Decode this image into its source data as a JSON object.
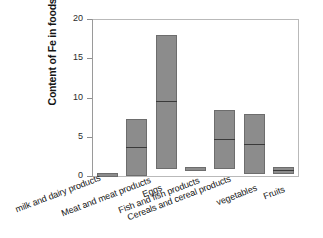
{
  "chart_data": {
    "type": "bar",
    "title": "",
    "xlabel": "",
    "ylabel": "Content of Fe in foods",
    "ylim": [
      0,
      20
    ],
    "yticks": [
      0,
      5,
      10,
      15,
      20
    ],
    "ytick_labels": [
      "0",
      "5",
      "10",
      "15",
      "20"
    ],
    "grid": false,
    "legend": "none",
    "note": "Box-style ranges: each category drawn as a filled box spanning min to max with a median line.",
    "categories": [
      "milk and dairy products",
      "Eggs",
      "Meat and meat products",
      "Fish and fish products",
      "Cereals and cereal products",
      "vegetables",
      "Fruits"
    ],
    "series": [
      {
        "name": "min",
        "values": [
          0.1,
          0.0,
          0.9,
          0.8,
          0.9,
          0.2,
          0.3
        ]
      },
      {
        "name": "median",
        "values": [
          0.25,
          3.7,
          9.5,
          0.95,
          4.7,
          4.1,
          0.75
        ]
      },
      {
        "name": "max",
        "values": [
          0.35,
          7.2,
          18.0,
          1.1,
          8.4,
          7.9,
          1.2
        ]
      }
    ],
    "boxes": [
      {
        "label": "milk and dairy products",
        "min": 0.1,
        "median": 0.25,
        "max": 0.35
      },
      {
        "label": "Eggs",
        "min": 0.0,
        "median": 3.7,
        "max": 7.2
      },
      {
        "label": "Meat and meat products",
        "min": 0.9,
        "median": 9.5,
        "max": 18.0
      },
      {
        "label": "Fish and fish products",
        "min": 0.8,
        "median": 0.95,
        "max": 1.1
      },
      {
        "label": "Cereals and cereal products",
        "min": 0.9,
        "median": 4.7,
        "max": 8.4
      },
      {
        "label": "vegetables",
        "min": 0.2,
        "median": 4.1,
        "max": 7.9
      },
      {
        "label": "Fruits",
        "min": 0.3,
        "median": 0.75,
        "max": 1.2
      }
    ],
    "colors": {
      "box_fill": "#8c8c8c",
      "box_edge": "#6d6d6d",
      "median_line": "#3a3a3a",
      "axis": "#9a9a9a",
      "frame": "#b9b9b9",
      "text": "#161616",
      "background": "#ffffff"
    }
  }
}
